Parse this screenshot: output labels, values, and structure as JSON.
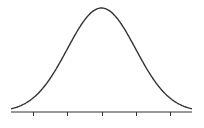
{
  "chart_data": {
    "type": "line",
    "title": "",
    "xlabel": "",
    "ylabel": "",
    "distribution": "normal",
    "mean": 0,
    "std": 1,
    "xlim": [
      -2.65,
      2.65
    ],
    "ylim": [
      0,
      0.3989
    ],
    "x_ticks": [
      -2,
      -1,
      0,
      1,
      2
    ],
    "x_tick_labels": [
      "",
      "",
      "",
      "",
      ""
    ],
    "y_axis_visible": false,
    "grid": false,
    "legend": null,
    "series": [
      {
        "name": "density",
        "x": [
          -2.65,
          -2.5,
          -2.0,
          -1.5,
          -1.0,
          -0.5,
          0.0,
          0.5,
          1.0,
          1.5,
          2.0,
          2.5,
          2.65
        ],
        "values": [
          0.0119,
          0.0175,
          0.054,
          0.1295,
          0.242,
          0.3521,
          0.3989,
          0.3521,
          0.242,
          0.1295,
          0.054,
          0.0175,
          0.0119
        ]
      }
    ]
  },
  "style": {
    "curve_color": "#333333",
    "axis_color": "#333333",
    "background": "#ffffff"
  }
}
